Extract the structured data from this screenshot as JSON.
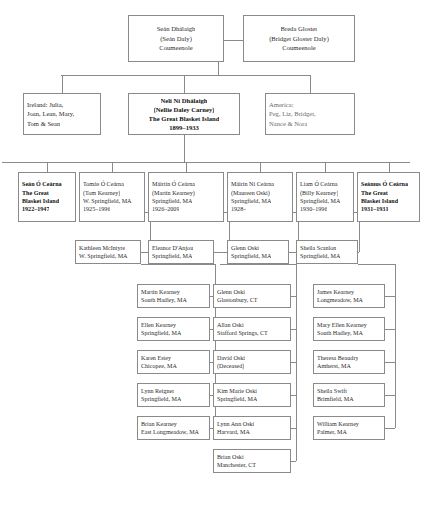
{
  "diagram": {
    "type": "genealogy-tree",
    "line_color": "#8a8a8a",
    "generations": [
      {
        "name": "grandparents",
        "nodes": [
          {
            "id": "sean-dhalaigh",
            "lines": [
              "Seán Dhálaigh",
              "(Seán Daly)",
              "Coumeenole"
            ],
            "emphasis": "normal"
          },
          {
            "id": "breda-gloster",
            "lines": [
              "Breda Gloster",
              "(Bridget Gloster Daly)",
              "Coumeenole"
            ],
            "emphasis": "normal"
          }
        ]
      },
      {
        "name": "children-of-daly",
        "nodes": [
          {
            "id": "ireland-siblings",
            "lines": [
              "Ireland: Julia,",
              "Joan, Lean, Mary,",
              "Tom & Sean"
            ],
            "emphasis": "normal"
          },
          {
            "id": "neli-ni-dhalaigh",
            "lines": [
              "Neli Ní Dhálaigh",
              "(Nellie Daley Carney)",
              "The Great Blasket Island",
              "1899–1933"
            ],
            "emphasis": "bold"
          },
          {
            "id": "america-siblings",
            "lines": [
              "America:",
              "Peg, Liz, Bridget,",
              "Nance & Nora"
            ],
            "emphasis": "dim"
          }
        ]
      },
      {
        "name": "o-cearna-children",
        "nodes": [
          {
            "id": "sean-o-cearna",
            "lines": [
              "Seán Ó Ceárna",
              "The Great",
              "Blasket Island",
              "1922–1947"
            ],
            "emphasis": "bold"
          },
          {
            "id": "tomas-o-cearna",
            "lines": [
              "Tomás Ó Ceárna",
              "(Tom Kearney)",
              "W. Springfield, MA",
              "1925–1996"
            ],
            "emphasis": "normal"
          },
          {
            "id": "mairtin-o-cearna",
            "lines": [
              "Máirtín Ó Ceárna",
              "(Martin Kearney)",
              "Springfield, MA",
              "1926–2009"
            ],
            "emphasis": "normal"
          },
          {
            "id": "mairin-ni-cearna",
            "lines": [
              "Máirín Ní Ceárna",
              "(Maureen Oski)",
              "Springfield, MA",
              "1928–"
            ],
            "emphasis": "normal"
          },
          {
            "id": "liam-o-cearna",
            "lines": [
              "Liam Ó Ceárna",
              "(Billy Kearney)",
              "Springfield, MA",
              "1930–1996"
            ],
            "emphasis": "normal"
          },
          {
            "id": "seamus-o-cearna",
            "lines": [
              "Seámus Ó Ceárna",
              "The Great",
              "Blasket Island",
              "1931–1931"
            ],
            "emphasis": "bold"
          }
        ]
      },
      {
        "name": "spouses",
        "nodes": [
          {
            "id": "kathleen-mcintyre",
            "lines": [
              "Kathleen McIntyre",
              "W. Springfield, MA"
            ],
            "emphasis": "normal"
          },
          {
            "id": "eleanor-danjou",
            "lines": [
              "Eleanor D'Anjou",
              "Springfield, MA"
            ],
            "emphasis": "normal"
          },
          {
            "id": "glenn-oski",
            "lines": [
              "Glenn Oski",
              "Springfield, MA"
            ],
            "emphasis": "normal"
          },
          {
            "id": "sheila-scanlon",
            "lines": [
              "Sheila Scanlon",
              "Springfield, MA"
            ],
            "emphasis": "normal"
          }
        ]
      },
      {
        "name": "grandchildren",
        "columns": [
          {
            "id": "kearney-column",
            "nodes": [
              {
                "id": "martin-kearney",
                "lines": [
                  "Martin Kearney",
                  "South Hadley, MA"
                ]
              },
              {
                "id": "ellen-kearney",
                "lines": [
                  "Ellen Kearney",
                  "Springfield, MA"
                ]
              },
              {
                "id": "karen-estey",
                "lines": [
                  "Karen Estey",
                  "Chicopee, MA"
                ]
              },
              {
                "id": "lynn-reigner",
                "lines": [
                  "Lynn Reigner",
                  "Springfield, MA"
                ]
              },
              {
                "id": "brian-kearney",
                "lines": [
                  "Brian Kearney",
                  "East Longmeadow, MA"
                ]
              }
            ]
          },
          {
            "id": "oski-column",
            "nodes": [
              {
                "id": "glenn-oski-jr",
                "lines": [
                  "Glenn Oski",
                  "Glastonbury, CT"
                ]
              },
              {
                "id": "allan-oski",
                "lines": [
                  "Allan Oski",
                  "Stafford Springs, CT"
                ]
              },
              {
                "id": "david-oski",
                "lines": [
                  "David Oski",
                  "(Deceased)"
                ]
              },
              {
                "id": "kim-marie-oski",
                "lines": [
                  "Kim Marie Oski",
                  "Springfield, MA"
                ]
              },
              {
                "id": "lynn-ann-oski",
                "lines": [
                  "Lynn Ann Oski",
                  "Harvard, MA"
                ]
              },
              {
                "id": "brian-oski",
                "lines": [
                  "Brian Oski",
                  "Manchester, CT"
                ]
              }
            ]
          },
          {
            "id": "scanlon-kearney-column",
            "nodes": [
              {
                "id": "james-kearney",
                "lines": [
                  "James Kearney",
                  "Longmeadow, MA"
                ]
              },
              {
                "id": "mary-ellen-kearney",
                "lines": [
                  "Mary Ellen Kearney",
                  "South Hadley, MA"
                ]
              },
              {
                "id": "theresa-beaudry",
                "lines": [
                  "Theresa Beaudry",
                  "Amherst, MA"
                ]
              },
              {
                "id": "sheila-swift",
                "lines": [
                  "Sheila Swift",
                  "Brimfield, MA"
                ]
              },
              {
                "id": "william-kearney",
                "lines": [
                  "William Kearney",
                  "Palmer, MA"
                ]
              }
            ]
          }
        ]
      }
    ]
  }
}
